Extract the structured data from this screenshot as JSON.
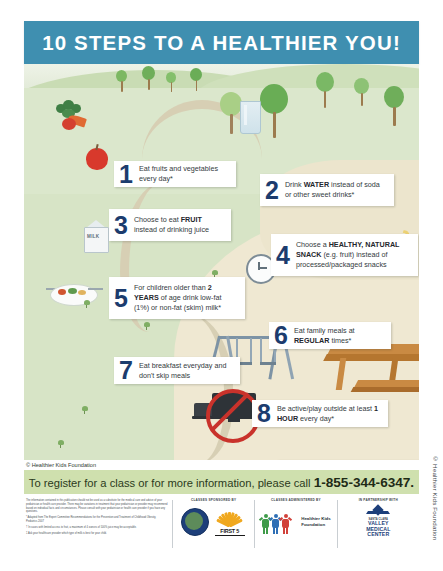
{
  "header": {
    "title": "10 STEPS TO A HEALTHIER YOU!"
  },
  "steps": [
    {
      "number": "1",
      "text_parts": [
        {
          "t": "Eat fruits and vegetables every day*",
          "bold": false
        }
      ],
      "plain": "Eat fruits and vegetables every day*"
    },
    {
      "number": "2",
      "text_parts": [
        {
          "t": "Drink ",
          "bold": false
        },
        {
          "t": "WATER",
          "bold": true
        },
        {
          "t": " instead of soda or other sweet drinks*",
          "bold": false
        }
      ],
      "plain": "Drink WATER instead of soda or other sweet drinks*"
    },
    {
      "number": "3",
      "text_parts": [
        {
          "t": "Choose to eat ",
          "bold": false
        },
        {
          "t": "FRUIT",
          "bold": true
        },
        {
          "t": " instead of drinking juice",
          "bold": false
        }
      ],
      "plain": "Choose to eat FRUIT instead of drinking juice"
    },
    {
      "number": "4",
      "text_parts": [
        {
          "t": "Choose a ",
          "bold": false
        },
        {
          "t": "HEALTHY, NATURAL SNACK",
          "bold": true
        },
        {
          "t": " (e.g. fruit) instead of processed/packaged snacks",
          "bold": false
        }
      ],
      "plain": "Choose a HEALTHY, NATURAL SNACK (e.g. fruit) instead of processed/packaged snacks"
    },
    {
      "number": "5",
      "text_parts": [
        {
          "t": "For children older than ",
          "bold": false
        },
        {
          "t": "2 YEARS",
          "bold": true
        },
        {
          "t": " of age drink low-fat (1%) or non-fat (skim) milk*",
          "bold": false
        }
      ],
      "plain": "For children older than 2 YEARS of age drink low-fat (1%) or non-fat (skim) milk*"
    },
    {
      "number": "6",
      "text_parts": [
        {
          "t": "Eat family meals at ",
          "bold": false
        },
        {
          "t": "REGULAR",
          "bold": true
        },
        {
          "t": " times*",
          "bold": false
        }
      ],
      "plain": "Eat family meals at REGULAR times*"
    },
    {
      "number": "7",
      "text_parts": [
        {
          "t": "Eat breakfast everyday and don't skip meals",
          "bold": false
        }
      ],
      "plain": "Eat breakfast everyday and don't skip meals"
    },
    {
      "number": "8",
      "text_parts": [
        {
          "t": "Be active/play outside at least ",
          "bold": false
        },
        {
          "t": "1 HOUR",
          "bold": true
        },
        {
          "t": " every day*",
          "bold": false
        }
      ],
      "plain": "Be active/play outside at least 1 HOUR every day*"
    },
    {
      "number": "9",
      "text_parts": [
        {
          "t": "Have ",
          "bold": false
        },
        {
          "t": "LESS THAN 1-2 HOURS",
          "bold": true
        },
        {
          "t": " of non-homework related screen time per day* (TV/computer/video games/tablet/texting)",
          "bold": false
        }
      ],
      "plain": "Have LESS THAN 1-2 HOURS of non-homework related screen time per day* (TV/computer/video games/tablet/texting)"
    },
    {
      "number": "10",
      "text_parts": [
        {
          "t": "Get enough ",
          "bold": false
        },
        {
          "t": "SLEEP",
          "bold": true
        }
      ],
      "plain": "Get enough SLEEP"
    }
  ],
  "scene_copyright": "© Healthier Kids Foundation",
  "cta": {
    "text": "To register for a class or for more information, please call ",
    "phone": "1-855-344-6347."
  },
  "footer": {
    "fine_print": [
      "The information contained in this publication should not be used as a substitute for the medical care and advice of your pediatrician or health care provider. There may be variations in treatment that your pediatrician or provider may recommend based on individual facts and circumstances. Please consult with your pediatrician or health care provider if you have any questions.",
      "* Adapted from The Expert Committee Recommendations for the Prevention and Treatment of Childhood Obesity, Pediatrics 2007",
      "† In cases with limited access to fruit, a maximum of 4 ounces of 100% juice may be acceptable.",
      "‡ Ask your healthcare provider which type of milk is best for your child."
    ],
    "columns": [
      {
        "heading": "CLASSES SPONSORED BY",
        "logos": [
          "county-seal",
          "first-5"
        ],
        "first5_label": "FIRST 5"
      },
      {
        "heading": "CLASSES ADMINISTERED BY",
        "logos": [
          "healthier-kids-people"
        ],
        "org_name_line1": "Healthier Kids",
        "org_name_line2": "Foundation"
      },
      {
        "heading": "IN PARTNERSHIP WITH",
        "logos": [
          "scvmc-mark"
        ],
        "scv_top": "SANTA CLARA",
        "scv_l1": "VALLEY",
        "scv_l2": "MEDICAL",
        "scv_l3": "CENTER"
      }
    ]
  },
  "edge_copyright": "© Healthier Kids Foundation",
  "colors": {
    "header_band": "#3f8fb0",
    "cta_band": "#cfe0ae",
    "scene_grass": "#dbe7cc",
    "scene_sand": "#efe8d2",
    "number_blue": "#1c3c6e",
    "apple_red": "#d8392c",
    "no_sign_red": "#c9322b"
  }
}
